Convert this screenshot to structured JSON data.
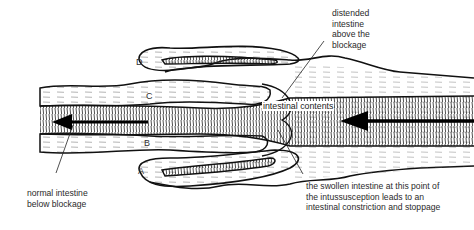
{
  "diagram": {
    "labels": {
      "distended": [
        "distended",
        "intestine",
        "above the",
        "blockage"
      ],
      "contents": "intestinal contents",
      "normal": [
        "normal intestine",
        "below blockage"
      ],
      "swollen": [
        "the swollen intestine at this point of",
        "the intussusception leads to an",
        "intestinal constriction and stoppage"
      ]
    },
    "layer_letters": [
      "A",
      "B",
      "C",
      "D"
    ],
    "colors": {
      "ink": "#111111",
      "text": "#2a2a2a",
      "background": "#ffffff"
    }
  }
}
